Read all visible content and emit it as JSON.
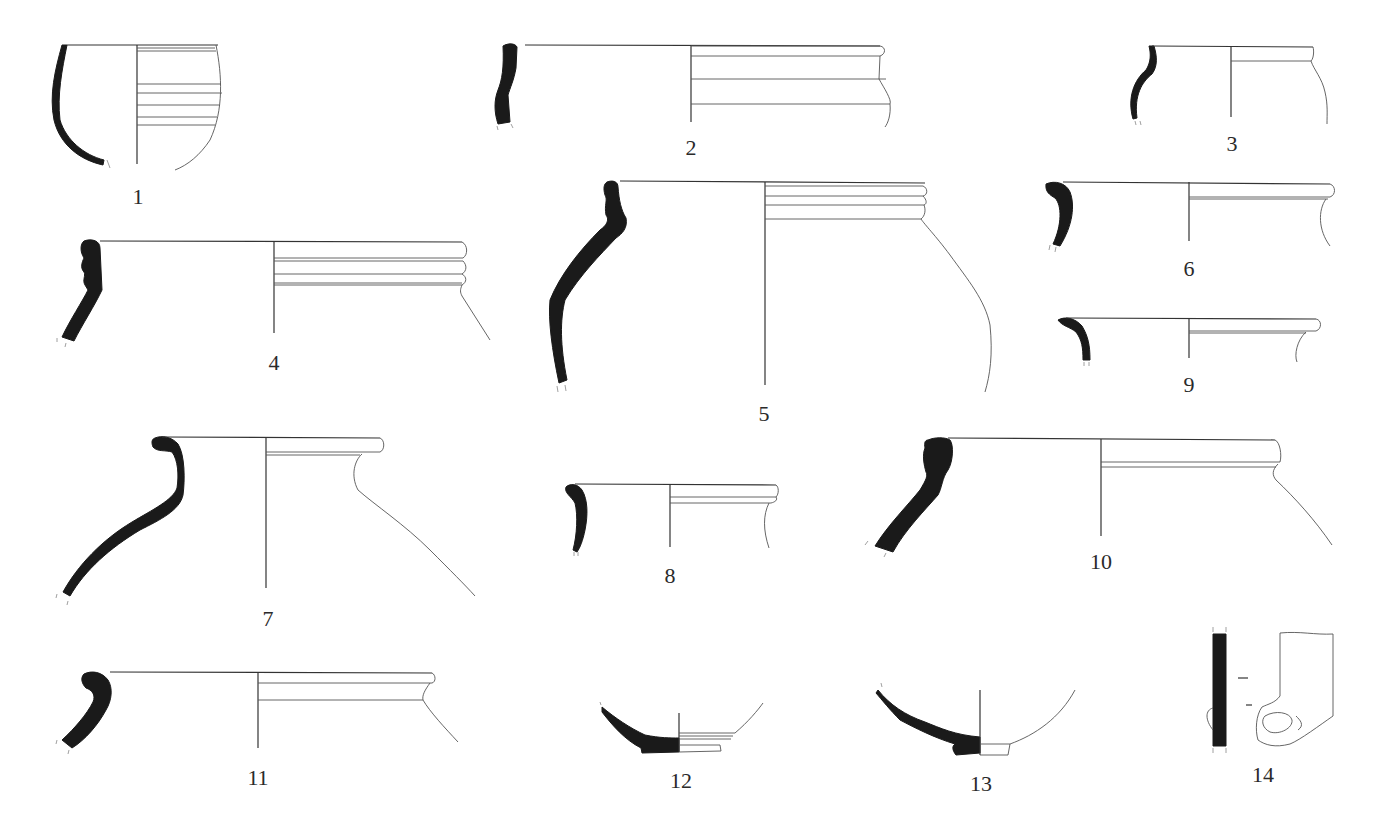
{
  "plate": {
    "description": "Archaeological pottery profile drawings plate",
    "background": "#ffffff",
    "section_fill": "#1a1a1a",
    "line_color": "#333333"
  },
  "figures": [
    {
      "number": "1",
      "type": "hemispherical bowl with grooves",
      "label_pos": [
        138,
        186
      ]
    },
    {
      "number": "2",
      "type": "wide jar rim, vertical neck",
      "label_pos": [
        691,
        137
      ]
    },
    {
      "number": "3",
      "type": "small S-profile jar",
      "label_pos": [
        1232,
        133
      ]
    },
    {
      "number": "4",
      "type": "ribbed rim jar",
      "label_pos": [
        274,
        352
      ]
    },
    {
      "number": "5",
      "type": "globular jar with grooved neck",
      "label_pos": [
        764,
        403
      ]
    },
    {
      "number": "6",
      "type": "everted rim jar",
      "label_pos": [
        1189,
        258
      ]
    },
    {
      "number": "7",
      "type": "rolled rim jar with flared shoulder",
      "label_pos": [
        268,
        608
      ]
    },
    {
      "number": "8",
      "type": "small everted rim jar",
      "label_pos": [
        670,
        565
      ]
    },
    {
      "number": "9",
      "type": "small everted rim",
      "label_pos": [
        1189,
        374
      ]
    },
    {
      "number": "10",
      "type": "heavy collared rim jar",
      "label_pos": [
        1101,
        551
      ]
    },
    {
      "number": "11",
      "type": "hooked rim jar",
      "label_pos": [
        258,
        767
      ]
    },
    {
      "number": "12",
      "type": "ring-foot base",
      "label_pos": [
        681,
        770
      ]
    },
    {
      "number": "13",
      "type": "flat foot base",
      "label_pos": [
        981,
        773
      ]
    },
    {
      "number": "14",
      "type": "handle / body fragment",
      "label_pos": [
        1263,
        764
      ]
    }
  ]
}
